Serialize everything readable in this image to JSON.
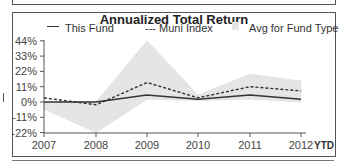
{
  "chart_data": {
    "type": "line",
    "title": "Annualized Total Return",
    "xlabel": "",
    "ylabel": "",
    "categories": [
      "2007",
      "2008",
      "2009",
      "2010",
      "2011",
      "2012"
    ],
    "x_suffix_label": "YTD",
    "y_ticks": [
      "44%",
      "33%",
      "22%",
      "11%",
      "0%",
      "-11%",
      "-22%"
    ],
    "ylim": [
      -22,
      44
    ],
    "grid": false,
    "legend_position": "top",
    "series": [
      {
        "name": "This Fund",
        "style": "solid",
        "values": [
          0,
          0,
          5,
          2,
          5,
          2
        ]
      },
      {
        "name": "Muni Index",
        "style": "dashed",
        "values": [
          3,
          -2,
          14,
          3,
          11,
          8
        ]
      },
      {
        "name": "Avg for Fund Type",
        "style": "area",
        "upper": [
          0,
          0,
          44,
          5,
          20,
          15
        ],
        "lower": [
          -5,
          -22,
          2,
          1,
          2,
          0
        ]
      }
    ],
    "colors": {
      "line": "#333333",
      "area": "#e5e5e5",
      "axis": "#555555"
    }
  },
  "legend": {
    "this_fund": "This Fund",
    "muni_index": "--- Muni Index",
    "avg_fund_type": "Avg for Fund Type"
  }
}
